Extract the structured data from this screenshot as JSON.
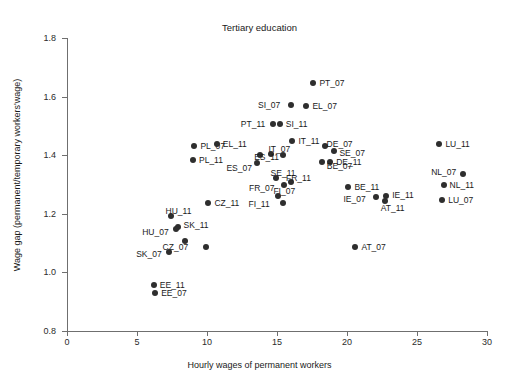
{
  "chart_data": {
    "type": "scatter",
    "title": "Tertiary education",
    "xlabel": "Hourly wages of permanent workers",
    "ylabel": "Wage gap (permanent/temporary workers'wage)",
    "xlim": [
      0,
      30
    ],
    "ylim": [
      0.8,
      1.8
    ],
    "xticks": [
      "0",
      "5",
      "10",
      "15",
      "20",
      "25",
      "30"
    ],
    "xtick_values": [
      0,
      5,
      10,
      15,
      20,
      25,
      30
    ],
    "yticks": [
      "0.8",
      "1.0",
      "1.2",
      "1.4",
      "1.6",
      "1.8"
    ],
    "ytick_values": [
      0.8,
      1.0,
      1.2,
      1.4,
      1.6,
      1.8
    ],
    "grid": false,
    "legend": null,
    "marker_color": "#2e2e2e",
    "points": [
      {
        "label": "PT_07",
        "x": 17.6,
        "y": 1.645,
        "lx": 6,
        "ly": -4
      },
      {
        "label": "SI_07",
        "x": 16.0,
        "y": 1.573,
        "lx": -33,
        "ly": -4
      },
      {
        "label": "EL_07",
        "x": 17.1,
        "y": 1.568,
        "lx": 6,
        "ly": -4
      },
      {
        "label": "PT_11",
        "x": 14.7,
        "y": 1.507,
        "lx": -32,
        "ly": -4
      },
      {
        "label": "SI_11",
        "x": 15.2,
        "y": 1.507,
        "lx": 6,
        "ly": -4
      },
      {
        "label": "IT_11",
        "x": 16.1,
        "y": 1.447,
        "lx": 6,
        "ly": -4
      },
      {
        "label": "DE_07",
        "x": 18.4,
        "y": 1.432,
        "lx": 2,
        "ly": -6
      },
      {
        "label": "PL_07",
        "x": 9.1,
        "y": 1.432,
        "lx": 6,
        "ly": -4
      },
      {
        "label": "EL_11",
        "x": 10.7,
        "y": 1.437,
        "lx": 6,
        "ly": -4
      },
      {
        "label": "LU_11",
        "x": 26.6,
        "y": 1.437,
        "lx": 6,
        "ly": -4
      },
      {
        "label": "SE_07",
        "x": 19.1,
        "y": 1.413,
        "lx": 5,
        "ly": -2
      },
      {
        "label": "IT_07",
        "x": 14.6,
        "y": 1.405,
        "lx": -3,
        "ly": -9
      },
      {
        "label": "ES_11",
        "x": 13.8,
        "y": 1.4,
        "lx": -6,
        "ly": -2
      },
      {
        "label": "FI_11x",
        "x": 15.4,
        "y": 1.4,
        "lx": 99,
        "ly": 99
      },
      {
        "label": "DE_11",
        "x": 18.8,
        "y": 1.378,
        "lx": 6,
        "ly": -4
      },
      {
        "label": "PL_11",
        "x": 9.0,
        "y": 1.383,
        "lx": 6,
        "ly": -4
      },
      {
        "label": "ES_07",
        "x": 13.6,
        "y": 1.372,
        "lx": -31,
        "ly": 1
      },
      {
        "label": "NL_07",
        "x": 28.3,
        "y": 1.335,
        "lx": -32,
        "ly": -6
      },
      {
        "label": "BE_07",
        "x": 18.2,
        "y": 1.378,
        "lx": 5,
        "ly": 0
      },
      {
        "label": "SE_11",
        "x": 14.9,
        "y": 1.322,
        "lx": -5,
        "ly": -9
      },
      {
        "label": "FR_11",
        "x": 16.0,
        "y": 1.308,
        "lx": -5,
        "ly": -8
      },
      {
        "label": "FR_07",
        "x": 15.5,
        "y": 1.298,
        "lx": -35,
        "ly": -1
      },
      {
        "label": "NL_11",
        "x": 26.9,
        "y": 1.297,
        "lx": 6,
        "ly": -4
      },
      {
        "label": "BE_11",
        "x": 20.1,
        "y": 1.29,
        "lx": 6,
        "ly": -4
      },
      {
        "label": "LU_07",
        "x": 26.8,
        "y": 1.248,
        "lx": 6,
        "ly": -4
      },
      {
        "label": "IE_11",
        "x": 22.8,
        "y": 1.262,
        "lx": 6,
        "ly": -5
      },
      {
        "label": "IE_07",
        "x": 22.1,
        "y": 1.258,
        "lx": -33,
        "ly": -2
      },
      {
        "label": "AT_11",
        "x": 22.7,
        "y": 1.242,
        "lx": -4,
        "ly": 3
      },
      {
        "label": "FI_07",
        "x": 15.1,
        "y": 1.262,
        "lx": -5,
        "ly": -9
      },
      {
        "label": "FI_11",
        "x": 15.4,
        "y": 1.237,
        "lx": -34,
        "ly": -3
      },
      {
        "label": "CZ_11",
        "x": 10.1,
        "y": 1.236,
        "lx": 6,
        "ly": -4
      },
      {
        "label": "HU_11",
        "x": 7.4,
        "y": 1.192,
        "lx": -5,
        "ly": -9
      },
      {
        "label": "SK_11",
        "x": 7.9,
        "y": 1.155,
        "lx": 6,
        "ly": -6
      },
      {
        "label": "HU_07",
        "x": 7.8,
        "y": 1.148,
        "lx": -34,
        "ly": -1
      },
      {
        "label": "CZ_07",
        "x": 8.4,
        "y": 1.108,
        "lx": -22,
        "ly": 2
      },
      {
        "label": "CZ_07b",
        "x": 9.9,
        "y": 1.085,
        "lx": 99,
        "ly": 99
      },
      {
        "label": "SK_07",
        "x": 7.3,
        "y": 1.068,
        "lx": -33,
        "ly": -2
      },
      {
        "label": "AT_07",
        "x": 20.6,
        "y": 1.085,
        "lx": 6,
        "ly": -4
      },
      {
        "label": "EE_11",
        "x": 6.2,
        "y": 0.957,
        "lx": 6,
        "ly": -4
      },
      {
        "label": "EE_07",
        "x": 6.3,
        "y": 0.928,
        "lx": 6,
        "ly": -4
      }
    ]
  }
}
